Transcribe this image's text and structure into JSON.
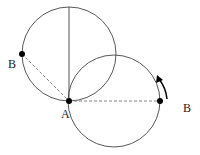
{
  "diagram": {
    "labels": {
      "a": "A",
      "b_left": "B",
      "b_right": "B"
    },
    "colors": {
      "stroke": "#333333",
      "dashed": "#777777",
      "point": "#000000"
    },
    "circles": [
      {
        "name": "upper-circle",
        "cx": 69,
        "cy": 54,
        "r": 47
      },
      {
        "name": "lower-circle",
        "cx": 114,
        "cy": 101,
        "r": 46
      }
    ]
  }
}
